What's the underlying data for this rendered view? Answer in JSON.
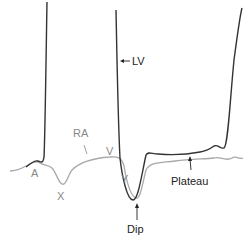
{
  "diagram": {
    "type": "pressure-tracing",
    "background": "#ffffff",
    "colors": {
      "lv_curve": "#333333",
      "ra_curve": "#a8a8a8",
      "dark_label": "#222222",
      "gray_label": "#888888"
    },
    "curves": [
      {
        "id": "lv",
        "name": "LV",
        "color": "#333333"
      },
      {
        "id": "ra",
        "name": "RA",
        "color": "#a8a8a8"
      }
    ],
    "labels": {
      "lv": "LV",
      "ra": "RA",
      "a_wave": "A",
      "x_descent": "X",
      "v_wave": "V",
      "y_descent": "Y",
      "plateau": "Plateau",
      "dip": "Dip"
    }
  }
}
